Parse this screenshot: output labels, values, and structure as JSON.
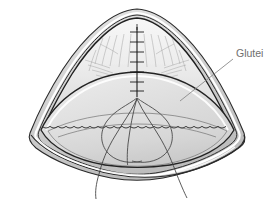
{
  "figure": {
    "background_color": "#ffffff",
    "width": 278,
    "height": 211
  },
  "labels": [
    {
      "id": "glutei",
      "text": "Glutei",
      "x": 236,
      "y": 57,
      "color": "#6e6e6e",
      "leader_line": {
        "from_x": 233,
        "from_y": 59,
        "to_x": 180,
        "to_y": 101,
        "color": "#8a8a8a"
      }
    }
  ],
  "colors": {
    "outline_dark": "#1e1e1e",
    "outline_mid": "#4a4a4a",
    "thread": "#3a3a3a",
    "fill_outer_rim": "#c9c9c9",
    "fill_mid_band": "#d4d4d4",
    "fill_inner": "#dedede",
    "fill_inner_light": "#e8e8e8",
    "highlight_white": "#ffffff",
    "shadow_grey": "#b4b4b4",
    "hatch_grey": "#9a9a9a",
    "label_grey": "#6e6e6e",
    "leader_grey": "#8a8a8a"
  },
  "anatomy": {
    "shape": "fan-shaped conical flap",
    "suture": {
      "name": "midline-suture",
      "stitch_count": 7,
      "top_y": 28,
      "bottom_y": 96,
      "x": 137
    },
    "thread_tails": 2,
    "scalloped_edge": true,
    "rim_layers": 4
  }
}
